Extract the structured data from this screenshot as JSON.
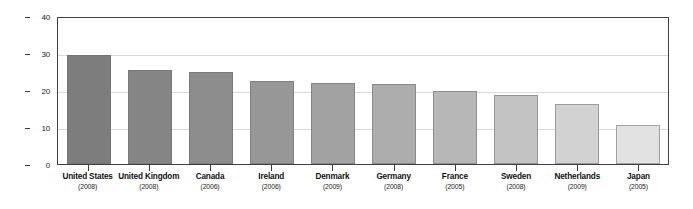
{
  "chart_data": {
    "type": "bar",
    "title": "",
    "xlabel": "",
    "ylabel": "Percent of Single Parent Households",
    "ylim": [
      0,
      40
    ],
    "yticks": [
      0,
      10,
      20,
      30,
      40
    ],
    "ytick_labels": [
      "0",
      "10",
      "20",
      "30",
      "40"
    ],
    "grid": true,
    "legend": "none",
    "categories": [
      "United States",
      "United Kingdom",
      "Canada",
      "Ireland",
      "Denmark",
      "Germany",
      "France",
      "Sweden",
      "Netherlands",
      "Japan"
    ],
    "category_years": [
      "(2008)",
      "(2008)",
      "(2006)",
      "(2006)",
      "(2009)",
      "(2008)",
      "(2005)",
      "(2008)",
      "(2009)",
      "(2005)"
    ],
    "values": [
      29.5,
      25.3,
      24.8,
      22.4,
      22.0,
      21.6,
      19.7,
      18.6,
      16.1,
      10.5
    ],
    "bar_colors": [
      "#7d7d7d",
      "#858585",
      "#8d8d8d",
      "#979797",
      "#a2a2a2",
      "#adadad",
      "#b7b7b7",
      "#c3c3c3",
      "#d2d2d2",
      "#e2e2e2"
    ],
    "axis_color": "#3f3f3f",
    "gridline_color": "#d9d9d9",
    "background_color": "#ffffff"
  }
}
